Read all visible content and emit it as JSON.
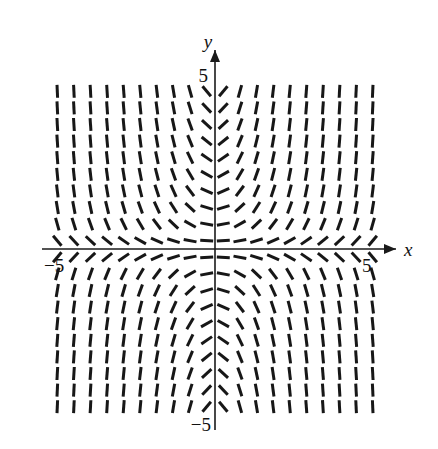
{
  "figure": {
    "title": "",
    "kind": "slope-field"
  },
  "axes": {
    "x_label": "x",
    "y_label": "y",
    "x_tick_left_label": "−5",
    "x_tick_right_label": "5",
    "y_tick_top_label": "5",
    "y_tick_bottom_label": "−5",
    "axis_color": "#1a1a1a",
    "segment_color": "#171717"
  },
  "chart_data": {
    "type": "scatter",
    "subtype": "slope-field",
    "title": "",
    "xlabel": "x",
    "ylabel": "y",
    "xlim": [
      -5.5,
      5.5
    ],
    "ylim": [
      -5.5,
      5.5
    ],
    "xticks": [
      -5,
      5
    ],
    "yticks": [
      -5,
      5
    ],
    "xtick_labels": [
      "−5",
      "5"
    ],
    "ytick_labels": [
      "−5",
      "5"
    ],
    "grid": false,
    "legend": null,
    "slope_formula": "dy/dx = x*y",
    "grid_x": [
      -4.75,
      -4.25,
      -3.75,
      -3.25,
      -2.75,
      -2.25,
      -1.75,
      -1.25,
      -0.75,
      -0.25,
      0.25,
      0.75,
      1.25,
      1.75,
      2.25,
      2.75,
      3.25,
      3.75,
      4.25,
      4.75
    ],
    "grid_y": [
      4.75,
      4.25,
      3.75,
      3.25,
      2.75,
      2.25,
      1.75,
      1.25,
      0.75,
      0.25,
      -0.25,
      -0.75,
      -1.25,
      -1.75,
      -2.25,
      -2.75,
      -3.25,
      -3.75,
      -4.25,
      -4.75
    ],
    "segment_length_px": 13
  },
  "geometry": {
    "origin_px": [
      215,
      249
    ],
    "unit_px": 33.2,
    "canvas": [
      438,
      449
    ]
  }
}
